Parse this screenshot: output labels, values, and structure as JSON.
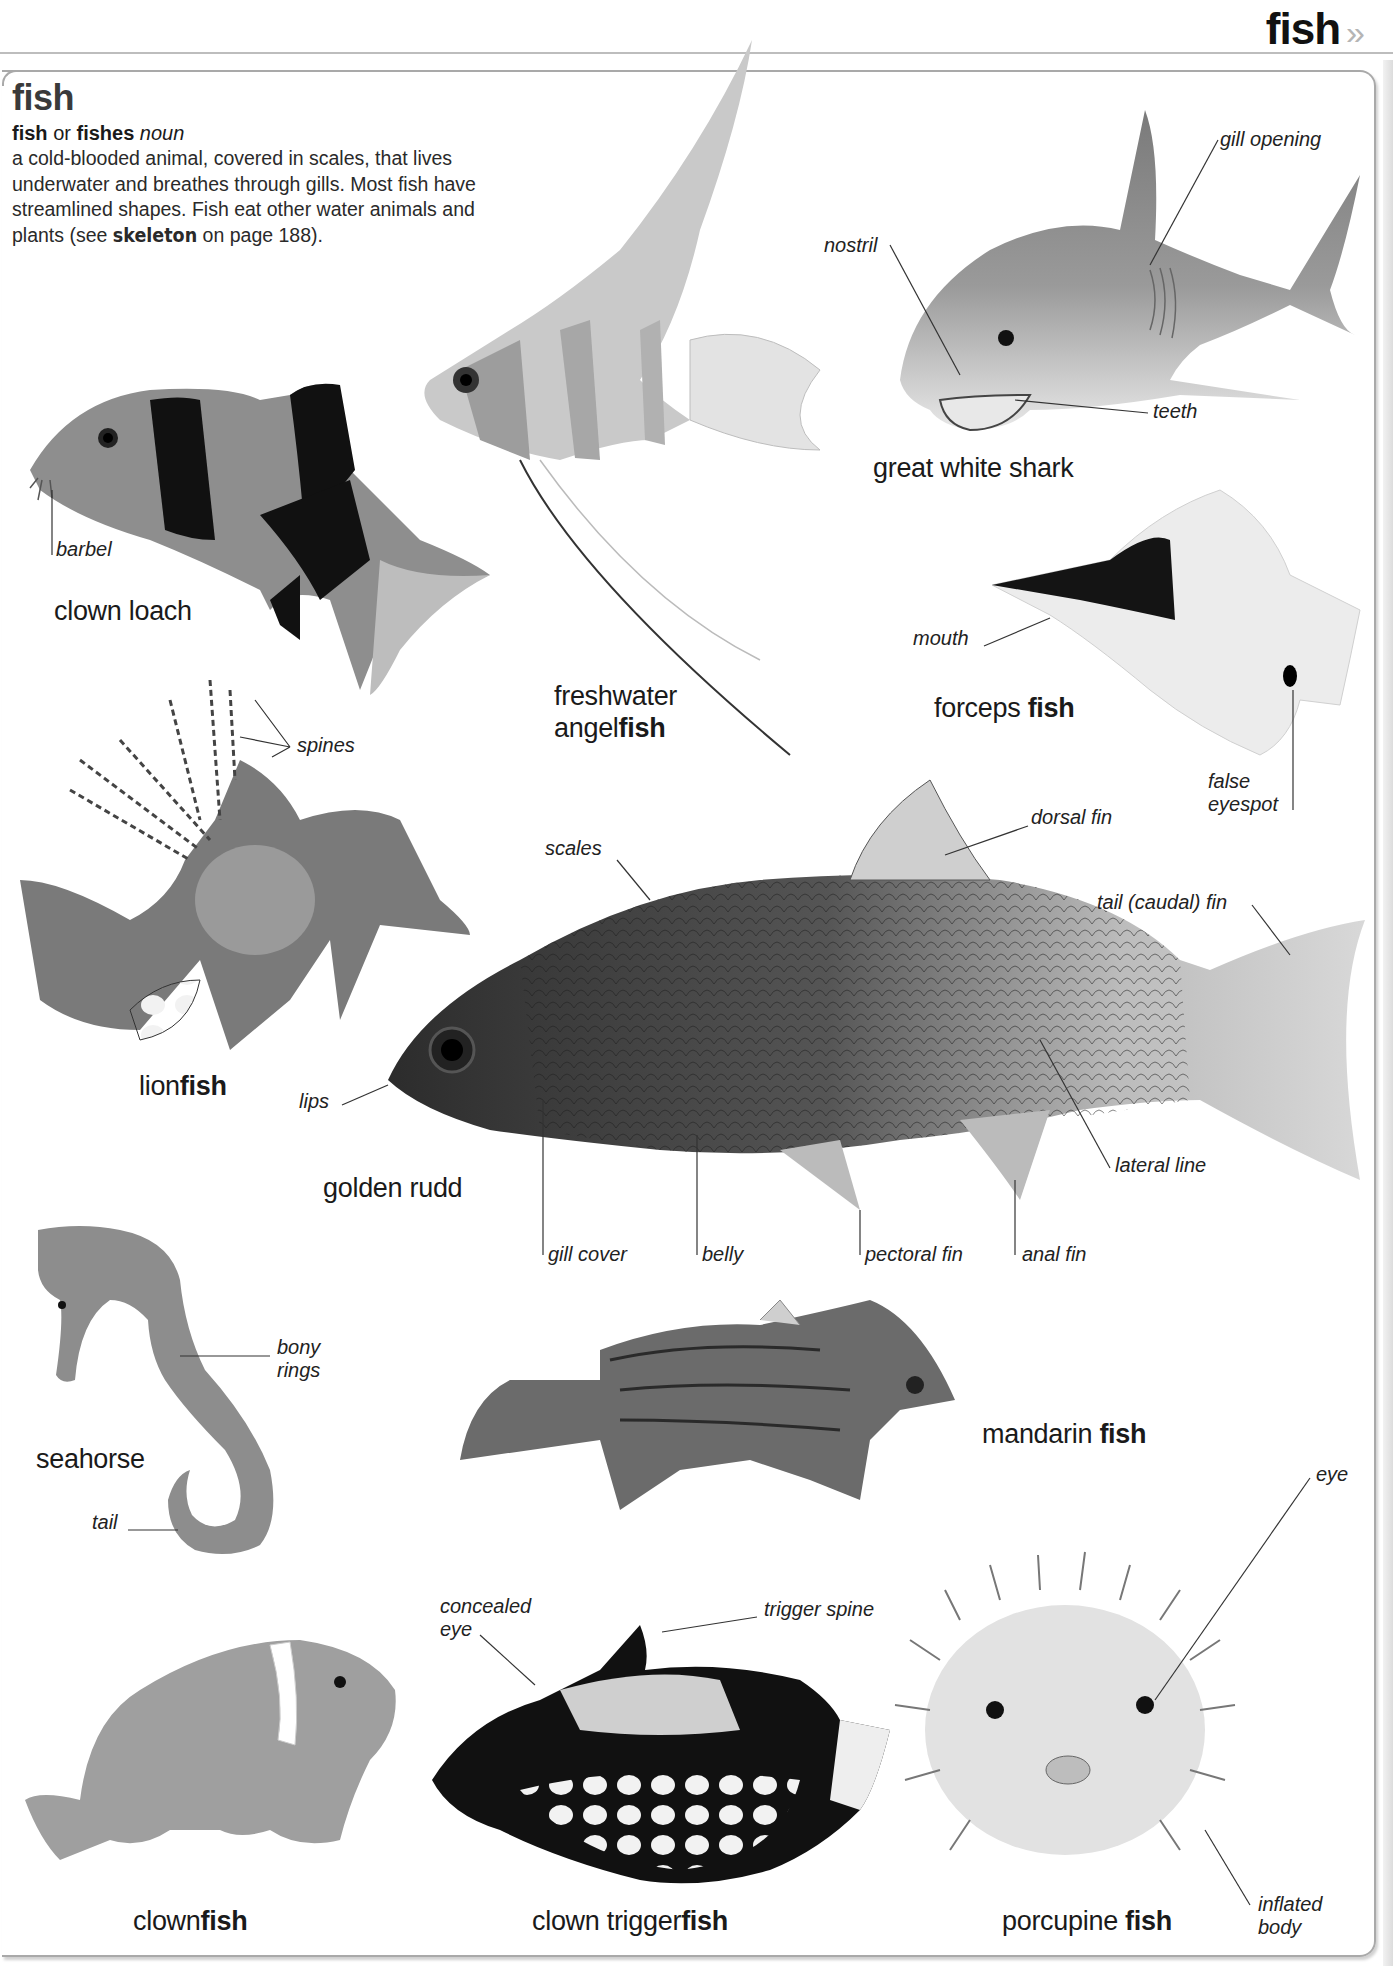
{
  "page": {
    "running_head": "fish",
    "running_head_chevron": "»"
  },
  "entry": {
    "headword": "fish",
    "forms": {
      "singular": "fish",
      "connector": "or",
      "plural": "fishes",
      "part_of_speech": "noun"
    },
    "definition": {
      "text": "a cold-blooded animal, covered in scales, that lives underwater and breathes through gills. Most fish have streamlined shapes. Fish eat other water animals and plants",
      "see_prefix": "(see",
      "see_term": "skeleton",
      "see_suffix": "on page 188)."
    }
  },
  "illustrations": [
    {
      "id": "clown-loach",
      "caption_plain": "clown loach",
      "caption_bold": "",
      "labels": [
        "barbel"
      ]
    },
    {
      "id": "freshwater-angelfish",
      "caption_plain": "freshwater",
      "caption_plain2": "angel",
      "caption_bold": "fish",
      "labels": []
    },
    {
      "id": "great-white-shark",
      "caption_plain": "great white shark",
      "caption_bold": "",
      "labels": [
        "nostril",
        "gill opening",
        "teeth"
      ]
    },
    {
      "id": "forceps-fish",
      "caption_plain": "forceps ",
      "caption_bold": "fish",
      "labels": [
        "mouth",
        "false",
        "eyespot"
      ]
    },
    {
      "id": "lionfish",
      "caption_plain": "lion",
      "caption_bold": "fish",
      "labels": [
        "spines"
      ]
    },
    {
      "id": "golden-rudd",
      "caption_plain": "golden rudd",
      "caption_bold": "",
      "labels": [
        "scales",
        "dorsal fin",
        "tail (caudal) fin",
        "lips",
        "lateral line",
        "gill cover",
        "belly",
        "pectoral fin",
        "anal fin"
      ]
    },
    {
      "id": "seahorse",
      "caption_plain": "seahorse",
      "caption_bold": "",
      "labels": [
        "bony",
        "rings",
        "tail"
      ]
    },
    {
      "id": "mandarin-fish",
      "caption_plain": "mandarin ",
      "caption_bold": "fish",
      "labels": []
    },
    {
      "id": "clownfish",
      "caption_plain": "clown",
      "caption_bold": "fish",
      "labels": []
    },
    {
      "id": "clown-triggerfish",
      "caption_plain": "clown trigger",
      "caption_bold": "fish",
      "labels": [
        "concealed",
        "eye",
        "trigger spine"
      ]
    },
    {
      "id": "porcupine-fish",
      "caption_plain": "porcupine ",
      "caption_bold": "fish",
      "labels": [
        "eye",
        "inflated",
        "body"
      ]
    }
  ],
  "colors": {
    "frame_border": "#a9a9a9",
    "header_rule": "#bdbdbd",
    "chevron": "#b5b5b5",
    "text": "#1a1a1a"
  }
}
